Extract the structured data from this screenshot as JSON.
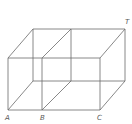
{
  "diagram": {
    "labels": {
      "A": "A",
      "B": "B",
      "C": "C",
      "T": "T"
    },
    "colors": {
      "line": "#6a6a6a",
      "label": "#555555",
      "background": "#ffffff"
    }
  }
}
